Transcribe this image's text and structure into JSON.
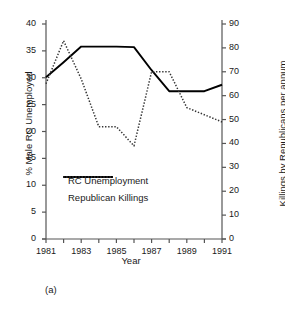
{
  "chart_data": {
    "type": "line",
    "title": "",
    "caption": "(a)",
    "xlabel": "Year",
    "ylabel": "% Male RC Unemployed",
    "y2label": "Killings by Republicans per annum",
    "x": [
      1981,
      1982,
      1983,
      1984,
      1985,
      1986,
      1987,
      1988,
      1989,
      1990,
      1991
    ],
    "xlim": [
      1981,
      1991
    ],
    "xticks": [
      1981,
      1982,
      1983,
      1984,
      1985,
      1986,
      1987,
      1988,
      1989,
      1990,
      1991
    ],
    "xticklabels": [
      "1981",
      "",
      "1983",
      "",
      "1985",
      "",
      "1987",
      "",
      "1989",
      "",
      "1991"
    ],
    "ylim": [
      0,
      40
    ],
    "yticks": [
      0,
      5,
      10,
      15,
      20,
      25,
      30,
      35,
      40
    ],
    "yticklabels": [
      "0",
      "5",
      "10",
      "15",
      "20",
      "25",
      "30",
      "35",
      "40"
    ],
    "y2lim": [
      0,
      90
    ],
    "y2ticks": [
      0,
      10,
      20,
      30,
      40,
      50,
      60,
      70,
      80,
      90
    ],
    "y2ticklabels": [
      "0",
      "10",
      "20",
      "30",
      "40",
      "50",
      "60",
      "70",
      "80",
      "90"
    ],
    "grid": false,
    "legend_position": "center-left",
    "series": [
      {
        "name": "RC Unemployment",
        "axis": "left",
        "style": "solid",
        "color": "#000000",
        "values": [
          30.1,
          32.9,
          35.8,
          35.8,
          35.8,
          35.7,
          31.4,
          27.5,
          27.5,
          27.5,
          28.7
        ]
      },
      {
        "name": "Republican Killings",
        "axis": "right",
        "style": "dotted",
        "color": "#333333",
        "values": [
          65,
          83,
          67,
          47,
          47,
          39,
          70,
          70,
          55,
          52,
          49
        ]
      }
    ]
  },
  "legend": {
    "items": [
      {
        "label": "RC Unemployment",
        "style": "solid"
      },
      {
        "label": "Republican Killings",
        "style": "dotted"
      }
    ]
  }
}
